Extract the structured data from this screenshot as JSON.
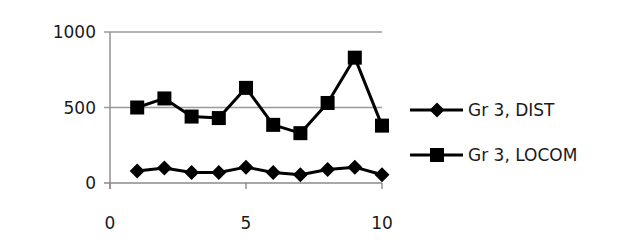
{
  "chart_data": {
    "type": "line",
    "title": "",
    "xlabel": "",
    "ylabel": "",
    "xlim": [
      0,
      10
    ],
    "ylim": [
      0,
      1000
    ],
    "x_ticks": [
      0,
      5,
      10
    ],
    "y_ticks": [
      0,
      500,
      1000
    ],
    "x_tick_labels": [
      "0",
      "5",
      "10"
    ],
    "y_tick_labels": [
      "0",
      "500",
      "1000"
    ],
    "grid": {
      "horizontal": true,
      "vertical": false
    },
    "legend_position": "right",
    "x": [
      1,
      2,
      3,
      4,
      5,
      6,
      7,
      8,
      9,
      10
    ],
    "series": [
      {
        "name": "Gr 3, DIST",
        "marker": "diamond",
        "color": "#000000",
        "values": [
          80,
          100,
          70,
          70,
          105,
          70,
          55,
          90,
          105,
          55
        ]
      },
      {
        "name": "Gr 3, LOCOM",
        "marker": "square",
        "color": "#000000",
        "values": [
          500,
          560,
          440,
          430,
          630,
          385,
          330,
          530,
          830,
          380
        ]
      }
    ]
  },
  "legend": {
    "items": [
      {
        "label": "Gr 3, DIST",
        "marker": "diamond-icon"
      },
      {
        "label": "Gr 3, LOCOM",
        "marker": "square-icon"
      }
    ]
  },
  "style": {
    "grid_color": "#9a9a9a",
    "axis_color": "#8a8a8a",
    "series_color": "#000000",
    "background": "#ffffff"
  }
}
